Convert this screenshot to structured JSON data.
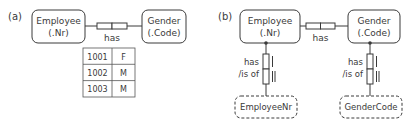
{
  "panel_a": {
    "label": "(a)",
    "entity_left": {
      "name": "Employee",
      "ref": "(.Nr)"
    },
    "entity_right": {
      "name": "Gender",
      "ref": "(.Code)"
    },
    "fact_reading": "has",
    "population": [
      [
        "1001",
        "F"
      ],
      [
        "1002",
        "M"
      ],
      [
        "1003",
        "M"
      ]
    ]
  },
  "panel_b": {
    "label": "(b)",
    "entity_left": {
      "name": "Employee",
      "ref": "(.Nr)"
    },
    "entity_right": {
      "name": "Gender",
      "ref": "(.Code)"
    },
    "fact_reading": "has",
    "ref_left": {
      "reading_1": "has",
      "reading_2": "/is of",
      "value_type": "EmployeeNr"
    },
    "ref_right": {
      "reading_1": "has",
      "reading_2": "/is of",
      "value_type": "GenderCode"
    }
  },
  "colors": {
    "stroke": "#3a3a3a",
    "text": "#3a3a3a",
    "background": "#ffffff"
  }
}
